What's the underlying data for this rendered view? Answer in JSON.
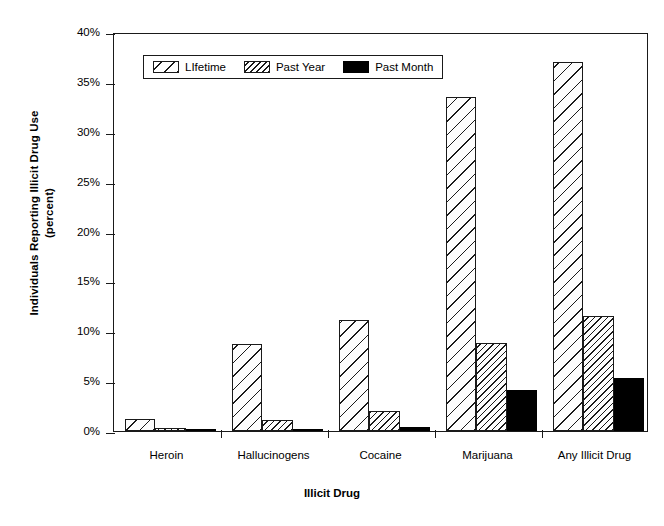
{
  "chart_data": {
    "type": "bar",
    "title": "",
    "xlabel": "Illicit Drug",
    "ylabel": "Individuals Reporting Illicit Drug Use (percent)",
    "ylabel_line1": "Individuals Reporting Illicit Drug Use",
    "ylabel_line2": "(percent)",
    "categories": [
      "Heroin",
      "Hallucinogens",
      "Cocaine",
      "Marijuana",
      "Any Illicit Drug"
    ],
    "series": [
      {
        "name": "LIfetime",
        "values": [
          1.2,
          8.7,
          11.1,
          33.5,
          37.0
        ],
        "fill": "diagonal-hatch-wide"
      },
      {
        "name": "Past Year",
        "values": [
          0.35,
          1.1,
          2.0,
          8.8,
          11.5
        ],
        "fill": "diagonal-hatch-dense"
      },
      {
        "name": "Past Month",
        "values": [
          0.05,
          0.15,
          0.4,
          4.1,
          5.3
        ],
        "fill": "solid-black"
      }
    ],
    "ylim": [
      0,
      40
    ],
    "ytick_values": [
      0,
      5,
      10,
      15,
      20,
      25,
      30,
      35,
      40
    ],
    "ytick_labels": [
      "0%",
      "5%",
      "10%",
      "15%",
      "20%",
      "25%",
      "30%",
      "35%",
      "40%"
    ],
    "grid": false,
    "legend_position": "top-left-inside",
    "colors": {
      "outline": "#1a1a1a",
      "past_month": "#000000",
      "background": "#ffffff"
    }
  }
}
